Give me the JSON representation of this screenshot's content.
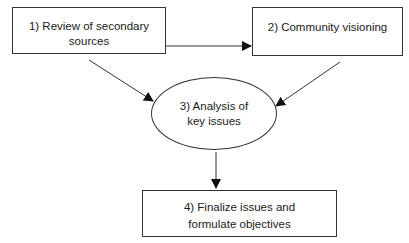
{
  "diagram": {
    "type": "flowchart",
    "nodes": [
      {
        "id": "1",
        "shape": "rectangle",
        "lines": [
          "1) Review of secondary",
          "sources"
        ]
      },
      {
        "id": "2",
        "shape": "rectangle",
        "lines": [
          "2) Community visioning"
        ]
      },
      {
        "id": "3",
        "shape": "ellipse",
        "lines": [
          "3) Analysis of",
          "key issues"
        ]
      },
      {
        "id": "4",
        "shape": "rectangle",
        "lines": [
          "4)  Finalize issues and",
          "formulate objectives"
        ]
      }
    ],
    "edges": [
      {
        "from": "1",
        "to": "2"
      },
      {
        "from": "1",
        "to": "3"
      },
      {
        "from": "2",
        "to": "3"
      },
      {
        "from": "3",
        "to": "4"
      }
    ],
    "colors": {
      "stroke": "#333333",
      "background": "#ffffff",
      "text": "#1a1a1a"
    }
  }
}
